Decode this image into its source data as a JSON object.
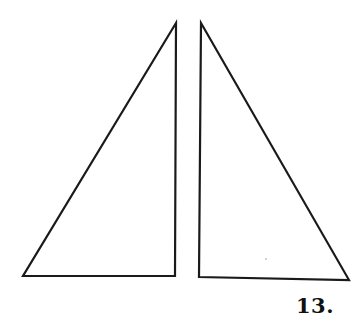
{
  "figure": {
    "label": "13.",
    "stroke_color": "#1a1a1a",
    "background": "#ffffff",
    "shapes": [
      {
        "name": "left-right-triangle",
        "type": "triangle",
        "points": [
          [
            176,
            23
          ],
          [
            23,
            276
          ],
          [
            175,
            276
          ]
        ],
        "right_angle_at": "bottom-right"
      },
      {
        "name": "right-right-triangle",
        "type": "triangle",
        "points": [
          [
            201,
            23
          ],
          [
            199,
            277
          ],
          [
            349,
            280
          ]
        ],
        "right_angle_at": "bottom-left"
      }
    ]
  }
}
